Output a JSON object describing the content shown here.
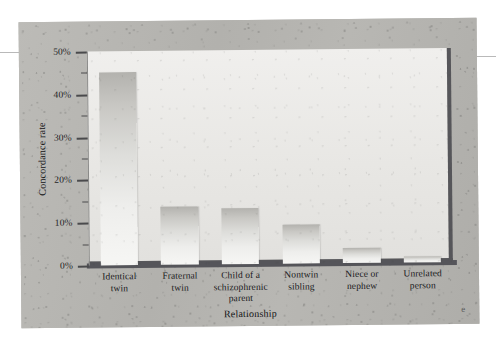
{
  "figure": {
    "corner_mark": "e"
  },
  "chart_data": {
    "type": "bar",
    "title": "",
    "xlabel": "Relationship",
    "ylabel": "Concordance rate",
    "ylim": [
      0,
      50
    ],
    "ytick_values": [
      0,
      10,
      20,
      30,
      40,
      50
    ],
    "ytick_labels": [
      "0%",
      "10%",
      "20%",
      "30%",
      "40%",
      "50%"
    ],
    "minor_ytick_values": [
      5,
      15,
      25,
      35,
      45
    ],
    "grid": false,
    "legend": false,
    "categories": [
      "Identical twin",
      "Fraternal twin",
      "Child of a schizophrenic parent",
      "Nontwin sibling",
      "Niece or nephew",
      "Unrelated person"
    ],
    "category_label_lines": [
      [
        "Identical",
        "twin"
      ],
      [
        "Fraternal",
        "twin"
      ],
      [
        "Child of a",
        "schizophrenic",
        "parent"
      ],
      [
        "Nontwin",
        "sibling"
      ],
      [
        "Niece or",
        "nephew"
      ],
      [
        "Unrelated",
        "person"
      ]
    ],
    "values": [
      45,
      13.5,
      13,
      9,
      3.5,
      1.5
    ],
    "value_unit": "%"
  },
  "colors": {
    "page_background": "#ffffff",
    "panel_paper": "#b5b4b0",
    "plot_field": "#eceae8",
    "axis_shadow": "#56565a",
    "bar_top": "#b3b2ae",
    "bar_bottom": "#f6f6f4",
    "text": "#1a1a1c"
  }
}
